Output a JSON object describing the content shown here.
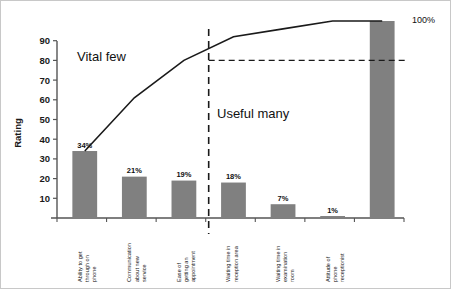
{
  "chart_data": {
    "type": "bar",
    "title": "",
    "subtitle": "",
    "xlabel": "",
    "ylabel": "Rating",
    "ylim": [
      0,
      100
    ],
    "ytick_labels": [
      "10",
      "20",
      "30",
      "40",
      "50",
      "60",
      "70",
      "80",
      "90"
    ],
    "ytick_values": [
      10,
      20,
      30,
      40,
      50,
      60,
      70,
      80,
      90
    ],
    "grid": false,
    "legend": false,
    "categories": [
      "Ability to get through on phone",
      "Communication about new service",
      "Ease of getting an appointment",
      "Waiting time in reception area",
      "Waiting time in examination room",
      "Attitude of phone receptionist"
    ],
    "category_lines": [
      [
        "Ability to get",
        "through on",
        "phone"
      ],
      [
        "Communication",
        "about new",
        "service"
      ],
      [
        "Ease of",
        "getting an",
        "appointment"
      ],
      [
        "Waiting time in",
        "reception area"
      ],
      [
        "Waiting time in",
        "examination",
        "room"
      ],
      [
        "Attitude of",
        "phone",
        "receptionist"
      ]
    ],
    "values": [
      34,
      21,
      19,
      18,
      7,
      1
    ],
    "value_labels": [
      "34%",
      "21%",
      "19%",
      "18%",
      "7%",
      "1%"
    ],
    "cumulative_values": [
      34,
      55,
      74,
      92,
      99,
      100
    ],
    "cumulative_curve_points": [
      34,
      61,
      80,
      92,
      96,
      100
    ],
    "total_bar_value": 100,
    "total_bar_label": "100%",
    "cutoff_reference_value": 80,
    "bar_color": "#808080",
    "line_color": "#1a1a1a",
    "annotations": [
      {
        "id": "vital-few",
        "text": "Vital few"
      },
      {
        "id": "useful-many",
        "text": "Useful many"
      },
      {
        "id": "total-percent",
        "text": "100%"
      }
    ]
  },
  "annotations": {
    "vital_few": "Vital few",
    "useful_many": "Useful many",
    "total_percent": "100%"
  },
  "colors": {
    "bar": "#808080",
    "line": "#1a1a1a",
    "axis": "#555555",
    "frame": "#c8c8c8",
    "background": "#ffffff"
  }
}
